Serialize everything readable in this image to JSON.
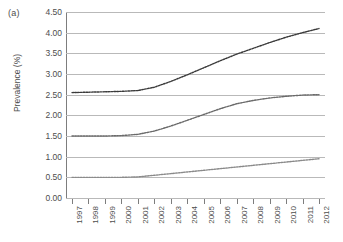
{
  "panel": {
    "label": "(a)"
  },
  "chart_data": {
    "type": "line",
    "title": "",
    "xlabel": "",
    "ylabel": "Prevalence (%)",
    "ylim": [
      0.0,
      4.5
    ],
    "ytick_labels": [
      "4.50",
      "4.00",
      "3.50",
      "3.00",
      "2.50",
      "2.00",
      "1.50",
      "1.00",
      "0.50",
      "0.00"
    ],
    "ytick_values": [
      4.5,
      4.0,
      3.5,
      3.0,
      2.5,
      2.0,
      1.5,
      1.0,
      0.5,
      0.0
    ],
    "grid": true,
    "legend": "none",
    "categories": [
      "1997",
      "1998",
      "1999",
      "2000",
      "2001",
      "2002",
      "2003",
      "2004",
      "2005",
      "2006",
      "2007",
      "2008",
      "2009",
      "2010",
      "2011",
      "2012"
    ],
    "x": [
      1997,
      1998,
      1999,
      2000,
      2001,
      2002,
      2003,
      2004,
      2005,
      2006,
      2007,
      2008,
      2009,
      2010,
      2011,
      2012
    ],
    "series": [
      {
        "name": "upper",
        "style": "dotted",
        "color": "#3a3a3a",
        "values": [
          2.55,
          2.56,
          2.57,
          2.58,
          2.6,
          2.68,
          2.82,
          2.98,
          3.15,
          3.32,
          3.48,
          3.62,
          3.76,
          3.89,
          4.0,
          4.1
        ]
      },
      {
        "name": "middle",
        "style": "dotted",
        "color": "#6a6a6a",
        "values": [
          1.5,
          1.5,
          1.5,
          1.51,
          1.54,
          1.62,
          1.74,
          1.88,
          2.02,
          2.16,
          2.28,
          2.36,
          2.42,
          2.46,
          2.49,
          2.5
        ]
      },
      {
        "name": "lower",
        "style": "dotted",
        "color": "#8a8a8a",
        "values": [
          0.5,
          0.5,
          0.5,
          0.5,
          0.51,
          0.55,
          0.59,
          0.63,
          0.67,
          0.71,
          0.75,
          0.79,
          0.83,
          0.87,
          0.91,
          0.95
        ]
      }
    ]
  }
}
